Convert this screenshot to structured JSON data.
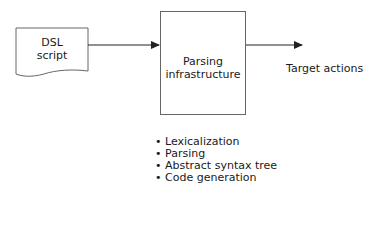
{
  "diagram": {
    "source": {
      "label_line1": "DSL",
      "label_line2": "script",
      "shape": "document"
    },
    "process": {
      "label_line1": "Parsing",
      "label_line2": "infrastructure",
      "shape": "rectangle"
    },
    "output": {
      "label": "Target actions"
    },
    "edges": [
      {
        "from": "DSL script",
        "to": "Parsing infrastructure",
        "type": "arrow"
      },
      {
        "from": "Parsing infrastructure",
        "to": "Target actions",
        "type": "arrow"
      }
    ],
    "steps": [
      "Lexicalization",
      "Parsing",
      "Abstract syntax tree",
      "Code generation"
    ],
    "colors": {
      "stroke": "#555555",
      "arrow": "#222222",
      "text": "#1a1a1a"
    }
  }
}
